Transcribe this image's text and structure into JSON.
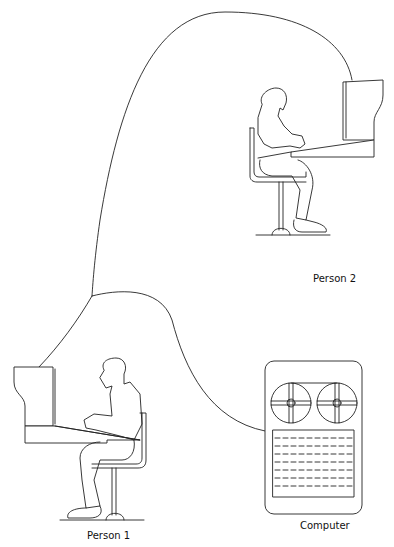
{
  "diagram": {
    "type": "network-illustration",
    "nodes": [
      {
        "id": "person2",
        "label": "Person 2",
        "kind": "person-at-terminal"
      },
      {
        "id": "person1",
        "label": "Person 1",
        "kind": "person-at-terminal"
      },
      {
        "id": "computer",
        "label": "Computer",
        "kind": "tape-reel-computer"
      }
    ],
    "edges": [
      {
        "from": "person2",
        "to": "junction"
      },
      {
        "from": "junction",
        "to": "person1"
      },
      {
        "from": "junction",
        "to": "computer"
      }
    ]
  },
  "labels": {
    "person2": "Person 2",
    "person1": "Person 1",
    "computer": "Computer"
  },
  "colors": {
    "line": "#222222",
    "background": "#ffffff"
  }
}
